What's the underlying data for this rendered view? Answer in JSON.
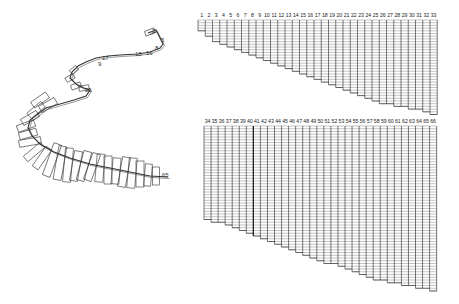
{
  "figure": {
    "left_panel": {
      "description": "3D ribbon/spiral structure with stacked rectangular segments",
      "labels": [
        {
          "text": "2",
          "x": 152,
          "y": 33
        },
        {
          "text": "5",
          "x": 161,
          "y": 42
        },
        {
          "text": "8",
          "x": 155,
          "y": 50
        },
        {
          "text": "16",
          "x": 146,
          "y": 55
        },
        {
          "text": "17",
          "x": 102,
          "y": 60
        },
        {
          "text": "18",
          "x": 135,
          "y": 56
        },
        {
          "text": "9",
          "x": 98,
          "y": 66
        },
        {
          "text": "25",
          "x": 85,
          "y": 92
        },
        {
          "text": "65",
          "x": 162,
          "y": 177
        }
      ],
      "path_points": [
        [
          148,
          33
        ],
        [
          156,
          30
        ],
        [
          160,
          38
        ],
        [
          163,
          44
        ],
        [
          160,
          48
        ],
        [
          150,
          52
        ],
        [
          138,
          54
        ],
        [
          120,
          55
        ],
        [
          108,
          56
        ],
        [
          96,
          58
        ],
        [
          86,
          62
        ],
        [
          78,
          66
        ],
        [
          72,
          72
        ],
        [
          70,
          78
        ],
        [
          76,
          84
        ],
        [
          84,
          88
        ],
        [
          90,
          90
        ],
        [
          86,
          96
        ],
        [
          74,
          100
        ],
        [
          60,
          104
        ],
        [
          46,
          108
        ],
        [
          38,
          114
        ],
        [
          30,
          120
        ],
        [
          28,
          128
        ],
        [
          32,
          136
        ],
        [
          40,
          144
        ],
        [
          54,
          152
        ],
        [
          70,
          158
        ],
        [
          90,
          164
        ],
        [
          110,
          168
        ],
        [
          130,
          172
        ],
        [
          150,
          176
        ],
        [
          168,
          177
        ]
      ],
      "rectangles": [
        {
          "cx": 150,
          "cy": 32,
          "w": 10,
          "h": 5,
          "rot": -20
        },
        {
          "cx": 74,
          "cy": 70,
          "w": 8,
          "h": 5,
          "rot": -40
        },
        {
          "cx": 70,
          "cy": 78,
          "w": 9,
          "h": 5,
          "rot": -30
        },
        {
          "cx": 76,
          "cy": 86,
          "w": 10,
          "h": 5,
          "rot": -20
        },
        {
          "cx": 84,
          "cy": 88,
          "w": 10,
          "h": 5,
          "rot": -10
        },
        {
          "cx": 40,
          "cy": 100,
          "w": 18,
          "h": 7,
          "rot": -35
        },
        {
          "cx": 48,
          "cy": 105,
          "w": 18,
          "h": 7,
          "rot": -30
        },
        {
          "cx": 36,
          "cy": 110,
          "w": 18,
          "h": 7,
          "rot": -40
        },
        {
          "cx": 30,
          "cy": 118,
          "w": 18,
          "h": 7,
          "rot": -30
        },
        {
          "cx": 26,
          "cy": 126,
          "w": 18,
          "h": 7,
          "rot": -20
        },
        {
          "cx": 28,
          "cy": 134,
          "w": 18,
          "h": 7,
          "rot": -15
        },
        {
          "cx": 30,
          "cy": 142,
          "w": 22,
          "h": 7,
          "rot": -10
        },
        {
          "cx": 34,
          "cy": 152,
          "w": 22,
          "h": 7,
          "rot": -40
        },
        {
          "cx": 42,
          "cy": 158,
          "w": 24,
          "h": 7,
          "rot": -55
        },
        {
          "cx": 52,
          "cy": 160,
          "w": 34,
          "h": 8,
          "rot": -70
        },
        {
          "cx": 60,
          "cy": 163,
          "w": 34,
          "h": 8,
          "rot": -80
        },
        {
          "cx": 68,
          "cy": 165,
          "w": 34,
          "h": 8,
          "rot": -85
        },
        {
          "cx": 76,
          "cy": 166,
          "w": 30,
          "h": 8,
          "rot": -80
        },
        {
          "cx": 84,
          "cy": 166,
          "w": 30,
          "h": 8,
          "rot": -75
        },
        {
          "cx": 92,
          "cy": 167,
          "w": 28,
          "h": 8,
          "rot": -70
        },
        {
          "cx": 100,
          "cy": 168,
          "w": 28,
          "h": 8,
          "rot": -85
        },
        {
          "cx": 108,
          "cy": 170,
          "w": 28,
          "h": 8,
          "rot": -90
        },
        {
          "cx": 116,
          "cy": 171,
          "w": 26,
          "h": 8,
          "rot": -85
        },
        {
          "cx": 124,
          "cy": 172,
          "w": 30,
          "h": 8,
          "rot": -80
        },
        {
          "cx": 132,
          "cy": 173,
          "w": 30,
          "h": 8,
          "rot": -85
        },
        {
          "cx": 140,
          "cy": 174,
          "w": 26,
          "h": 8,
          "rot": -90
        },
        {
          "cx": 148,
          "cy": 175,
          "w": 22,
          "h": 7,
          "rot": -85
        },
        {
          "cx": 156,
          "cy": 176,
          "w": 18,
          "h": 7,
          "rot": -90
        }
      ]
    },
    "top_grid": {
      "x": 198,
      "y": 15,
      "col_width": 7.25,
      "row_height": 2.7,
      "label_offset": 5,
      "columns": [
        "1",
        "2",
        "3",
        "4",
        "5",
        "6",
        "7",
        "8",
        "9",
        "10",
        "11",
        "12",
        "13",
        "14",
        "15",
        "16",
        "17",
        "18",
        "19",
        "20",
        "21",
        "22",
        "23",
        "24",
        "25",
        "26",
        "27",
        "28",
        "29",
        "30",
        "31",
        "32",
        "33"
      ],
      "depths": [
        4,
        6,
        8,
        9,
        10,
        11,
        12,
        13,
        14,
        15,
        16,
        17,
        18,
        19,
        20,
        21,
        22,
        23,
        24,
        25,
        26,
        27,
        28,
        29,
        30,
        31,
        31,
        32,
        32,
        33,
        33,
        34,
        35
      ]
    },
    "bottom_grid": {
      "x": 204,
      "y": 121,
      "col_width": 7.05,
      "row_height": 2.75,
      "label_offset": 5,
      "thick_after_column": "40",
      "columns": [
        "34",
        "35",
        "36",
        "37",
        "38",
        "39",
        "40",
        "41",
        "42",
        "43",
        "44",
        "45",
        "46",
        "47",
        "48",
        "49",
        "50",
        "51",
        "52",
        "53",
        "54",
        "55",
        "56",
        "57",
        "58",
        "59",
        "60",
        "61",
        "62",
        "63",
        "64",
        "65",
        "66"
      ],
      "depths": [
        34,
        35,
        35,
        36,
        37,
        38,
        39,
        40,
        41,
        42,
        43,
        44,
        45,
        46,
        47,
        48,
        49,
        50,
        50,
        51,
        52,
        53,
        54,
        55,
        56,
        56,
        57,
        57,
        58,
        58,
        59,
        59,
        60
      ]
    },
    "colors": {
      "line": "#333333",
      "grid_line": "#555555",
      "background": "#ffffff"
    }
  }
}
